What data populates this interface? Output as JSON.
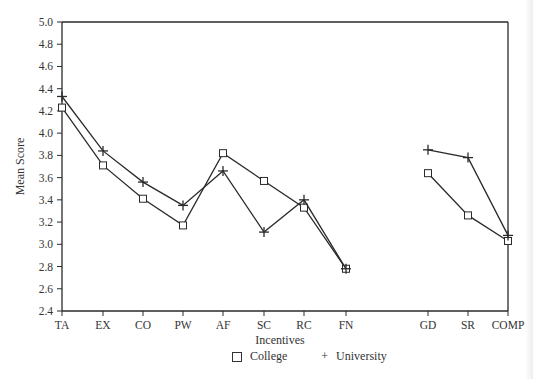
{
  "chart_data": {
    "type": "line",
    "title": "",
    "xlabel": "Incentives",
    "ylabel": "Mean Score",
    "ylim": [
      2.4,
      5.0
    ],
    "yticks": [
      "5.0",
      "4.8",
      "4.6",
      "4.4",
      "4.2",
      "4.0",
      "3.8",
      "3.6",
      "3.4",
      "3.2",
      "3.0",
      "2.8",
      "2.6",
      "2.4"
    ],
    "categories": [
      "TA",
      "EX",
      "CO",
      "PW",
      "AF",
      "SC",
      "RC",
      "FN",
      "GD",
      "SR",
      "COMP"
    ],
    "segments": [
      [
        0,
        7
      ],
      [
        8,
        10
      ]
    ],
    "grid": false,
    "legend_position": "bottom",
    "series": [
      {
        "name": "College",
        "marker": "square",
        "values": [
          4.23,
          3.71,
          3.41,
          3.17,
          3.82,
          3.57,
          3.33,
          2.78,
          3.64,
          3.26,
          3.03
        ]
      },
      {
        "name": "University",
        "marker": "plus",
        "values": [
          4.33,
          3.84,
          3.56,
          3.35,
          3.66,
          3.11,
          3.4,
          2.78,
          3.85,
          3.78,
          3.08
        ]
      }
    ]
  },
  "legend": {
    "college_label": "College",
    "university_label": "University"
  }
}
